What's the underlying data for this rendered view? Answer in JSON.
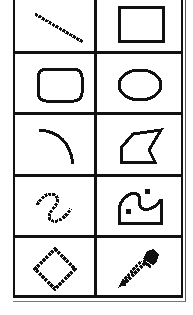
{
  "palette": {
    "name": "Tool Palette",
    "columns": 2,
    "rows": 5,
    "colors": {
      "ink": "#111111",
      "background": "#ffffff"
    },
    "tools": [
      {
        "id": "line",
        "icon": "line-icon",
        "label": "Line"
      },
      {
        "id": "rectangle",
        "icon": "rectangle-icon",
        "label": "Rectangle"
      },
      {
        "id": "rounded-rectangle",
        "icon": "rounded-rectangle-icon",
        "label": "Rounded Rectangle"
      },
      {
        "id": "oval",
        "icon": "oval-icon",
        "label": "Oval"
      },
      {
        "id": "arc",
        "icon": "arc-icon",
        "label": "Arc"
      },
      {
        "id": "polygon",
        "icon": "polygon-icon",
        "label": "Polygon"
      },
      {
        "id": "freehand",
        "icon": "freehand-icon",
        "label": "Freehand"
      },
      {
        "id": "freehand-fill",
        "icon": "freehand-fill-icon",
        "label": "Freehand Fill"
      },
      {
        "id": "regular-polygon",
        "icon": "diamond-icon",
        "label": "Regular Polygon"
      },
      {
        "id": "eyedropper",
        "icon": "eyedropper-icon",
        "label": "Eyedropper"
      }
    ]
  }
}
